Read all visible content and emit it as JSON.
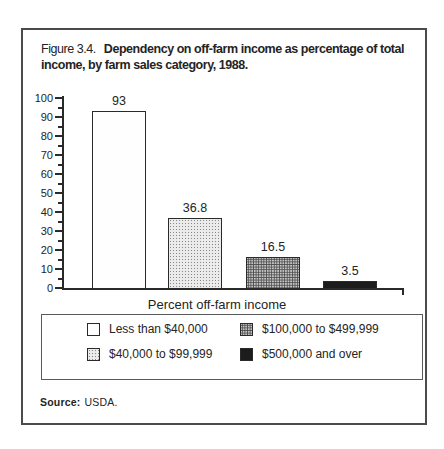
{
  "figure": {
    "number": "Figure 3.4.",
    "title_line1": "Dependency on off-farm income as percentage of total",
    "title_line2": "income, by farm sales category, 1988.",
    "source_label": "Source:",
    "source_value": "USDA."
  },
  "chart_data": {
    "type": "bar",
    "categories": [
      "Less than $40,000",
      "$40,000 to $99,999",
      "$100,000 to $499,999",
      "$500,000 and over"
    ],
    "values": [
      93,
      36.8,
      16.5,
      3.5
    ],
    "value_labels": [
      "93",
      "36.8",
      "16.5",
      "3.5"
    ],
    "xlabel": "Percent off-farm income",
    "ylabel": "",
    "ylim": [
      0,
      100
    ],
    "ytick_step": 10,
    "ytick_minor_step": 5,
    "grid": false,
    "legend_position": "bottom-box",
    "bar_fills": [
      "white",
      "light-stipple",
      "medium-stipple",
      "black"
    ],
    "legend": [
      {
        "label": "Less than $40,000",
        "fill": "white"
      },
      {
        "label": "$40,000 to $99,999",
        "fill": "light-stipple"
      },
      {
        "label": "$100,000 to $499,999",
        "fill": "medium-stipple"
      },
      {
        "label": "$500,000 and over",
        "fill": "black"
      }
    ]
  },
  "colors": {
    "ink": "#242424",
    "frame_border": "#4b4b4b",
    "legend_border": "#5a5a5a",
    "light_fill_bg": "#ebebeb",
    "medium_fill_bg": "#c6c6c6",
    "black_fill": "#1c1c1c"
  }
}
